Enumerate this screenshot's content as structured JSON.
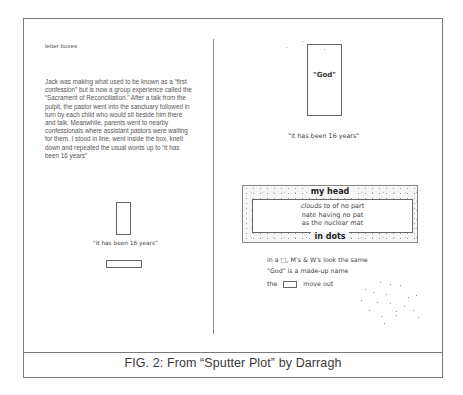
{
  "figure": {
    "caption": "FIG. 2: From “Sputter Plot” by Darragh",
    "left_panel": {
      "heading": "letter boxes",
      "paragraph": "Jack was making what used to be known as a “first confession” but is now a group experience called the “Sacrament of Reconciliation.”  After a talk from the pulpit, the pastor went into the sanctuary followed in turn by each child who would sit beside him there and talk.  Meanwhile, parents went to nearby confessionals where assistant pastors were waiting for them.  I stood in line, went inside the box, knelt down and repeated the usual words up to “it has been 16 years”",
      "box_caption": "\"it has been 16 years\""
    },
    "right_panel": {
      "god_label": "\"God\"",
      "quote": "\"it has been 16 years\"",
      "head_box": {
        "title": "my head",
        "footer": "in dots",
        "lines": [
          {
            "italic": "clouds",
            "rest": " to of no part"
          },
          {
            "italic": "",
            "rest": "nate having no pat"
          },
          {
            "italic": "",
            "rest": "as the nuclear mat"
          }
        ]
      },
      "lines": [
        "in a □, M's & W's look the same",
        "\"God\" is a made-up name"
      ],
      "last_line": {
        "before": "the",
        "after": "move out"
      }
    },
    "colors": {
      "frame": "#7a7a7a",
      "text": "#444444",
      "background": "#ffffff"
    }
  }
}
